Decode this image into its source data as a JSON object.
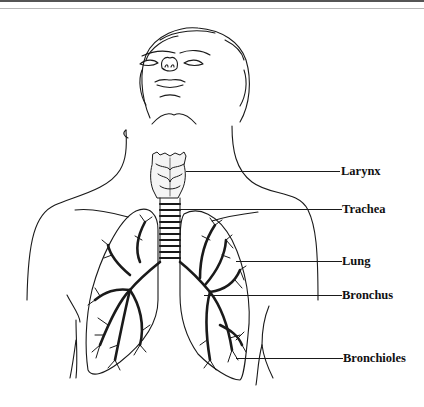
{
  "diagram": {
    "style": "black-and-white line illustration",
    "colors": {
      "ink": "#111111",
      "background": "#ffffff"
    },
    "labels": [
      {
        "id": "larynx",
        "text": "Larynx",
        "line_y": 171,
        "line_x_start": 186
      },
      {
        "id": "trachea",
        "text": "Trachea",
        "line_y": 209,
        "line_x_start": 180
      },
      {
        "id": "lung",
        "text": "Lung",
        "line_y": 261,
        "line_x_start": 236
      },
      {
        "id": "bronchus",
        "text": "Bronchus",
        "line_y": 295,
        "line_x_start": 204
      },
      {
        "id": "bronchioles",
        "text": "Bronchioles",
        "line_y": 358,
        "line_x_start": 236
      }
    ]
  }
}
